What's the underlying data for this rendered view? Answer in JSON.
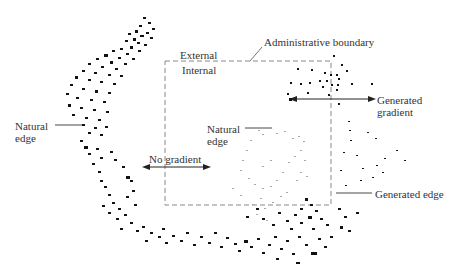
{
  "diagram": {
    "labels": {
      "administrative_boundary": "Administrative boundary",
      "external": "External",
      "internal": "Internal",
      "natural_edge_left_line1": "Natural",
      "natural_edge_left_line2": "edge",
      "natural_edge_center_line1": "Natural",
      "natural_edge_center_line2": "edge",
      "no_gradient": "No gradient",
      "generated_gradient_line1": "Generated",
      "generated_gradient_line2": "gradient",
      "generated_edge": "Generated edge"
    },
    "boundary_box": {
      "x": 165,
      "y": 61,
      "width": 166,
      "height": 144,
      "style": "dashed"
    },
    "colors": {
      "points": "#111111",
      "faint_points": "#9a9a9a",
      "lines": "#333333",
      "boundary": "#777777"
    }
  }
}
